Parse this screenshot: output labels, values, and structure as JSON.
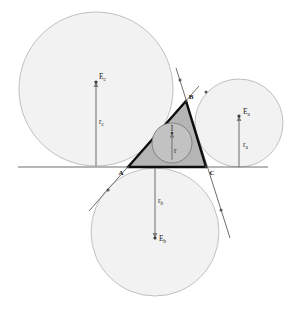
{
  "figure": {
    "name": "triangle-incircle-excircles-diagram",
    "background_color": "#ffffff"
  },
  "chart_data": {
    "type": "diagram",
    "title": "",
    "subtitle": "",
    "colors": {
      "excircle_fill": "#f2f2f2",
      "excircle_stroke": "#b9b9b9",
      "incircle_fill": "#c2c2c2",
      "incircle_stroke": "#7d7d7d",
      "triangle_fill": "#a8a8a8",
      "triangle_stroke": "#0d0d0d",
      "line_stroke": "#6f6f6f",
      "label_color": "#1a1a1a"
    },
    "vertices": [
      {
        "label": "A",
        "x": 128,
        "y": 167
      },
      {
        "label": "B",
        "x": 186,
        "y": 101
      },
      {
        "label": "C",
        "x": 206,
        "y": 167
      }
    ],
    "incircle": {
      "center_label": "I",
      "radius_label": "r",
      "cx": 172,
      "cy": 143,
      "r": 20
    },
    "excircles": [
      {
        "center_label": "E",
        "center_subscript": "c",
        "radius_label": "r",
        "radius_subscript": "c",
        "cx": 96,
        "cy": 89,
        "r": 77,
        "tangent_x": 96,
        "tangent_y": 166
      },
      {
        "center_label": "E",
        "center_subscript": "a",
        "radius_label": "r",
        "radius_subscript": "a",
        "cx": 239,
        "cy": 123,
        "r": 44,
        "tangent_x": 239,
        "tangent_y": 167
      },
      {
        "center_label": "E",
        "center_subscript": "b",
        "radius_label": "r",
        "radius_subscript": "b",
        "cx": 155,
        "cy": 232,
        "r": 64,
        "tangent_x": 155,
        "tangent_y": 168
      }
    ],
    "labels": [
      "A",
      "B",
      "C",
      "I",
      "r",
      "E_a",
      "r_a",
      "E_b",
      "r_b",
      "E_c",
      "r_c"
    ]
  },
  "annotations": {
    "vertex_a": "A",
    "vertex_b": "B",
    "vertex_c": "C",
    "incenter": "I",
    "inradius": "r",
    "excenter_a_base": "E",
    "excenter_a_sub": "a",
    "exradius_a_base": "r",
    "exradius_a_sub": "a",
    "excenter_b_base": "E",
    "excenter_b_sub": "b",
    "exradius_b_base": "r",
    "exradius_b_sub": "b",
    "excenter_c_base": "E",
    "excenter_c_sub": "c",
    "exradius_c_base": "r",
    "exradius_c_sub": "c"
  }
}
